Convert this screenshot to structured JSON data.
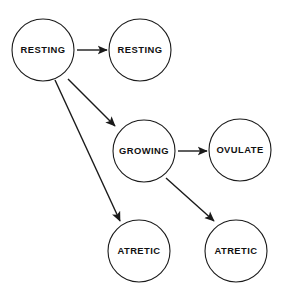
{
  "diagram": {
    "background_color": "#ffffff",
    "stroke_color": "#1a1a1a",
    "nodes": [
      {
        "id": "resting_pool",
        "label": "RESTING",
        "cx": 43,
        "cy": 50,
        "r": 31
      },
      {
        "id": "resting_stay",
        "label": "RESTING",
        "cx": 140,
        "cy": 50,
        "r": 31
      },
      {
        "id": "growing",
        "label": "GROWING",
        "cx": 144,
        "cy": 151,
        "r": 31
      },
      {
        "id": "ovulate",
        "label": "OVULATE",
        "cx": 240,
        "cy": 150,
        "r": 31
      },
      {
        "id": "atretic_left",
        "label": "ATRETIC",
        "cx": 139,
        "cy": 251,
        "r": 31
      },
      {
        "id": "atretic_right",
        "label": "ATRETIC",
        "cx": 236,
        "cy": 251,
        "r": 31
      }
    ],
    "edges": [
      {
        "id": "resting-to-resting",
        "from": "resting_pool",
        "to": "resting_stay",
        "x1": 77,
        "y1": 50,
        "x2": 107,
        "y2": 50
      },
      {
        "id": "resting-to-growing",
        "from": "resting_pool",
        "to": "growing",
        "x1": 68,
        "y1": 79,
        "x2": 115,
        "y2": 126
      },
      {
        "id": "resting-to-atretic",
        "from": "resting_pool",
        "to": "atretic_left",
        "x1": 55,
        "y1": 80,
        "x2": 120,
        "y2": 221
      },
      {
        "id": "growing-to-ovulate",
        "from": "growing",
        "to": "ovulate",
        "x1": 178,
        "y1": 151,
        "x2": 207,
        "y2": 151
      },
      {
        "id": "growing-to-atretic",
        "from": "growing",
        "to": "atretic_right",
        "x1": 166,
        "y1": 178,
        "x2": 214,
        "y2": 221
      }
    ]
  }
}
